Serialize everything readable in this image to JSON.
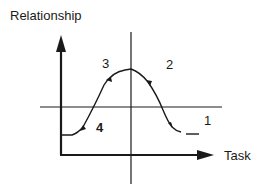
{
  "diagram": {
    "y_axis_label": "Relationship",
    "x_axis_label": "Task",
    "regions": [
      {
        "id": "1",
        "label": "1",
        "position": "lower-right"
      },
      {
        "id": "2",
        "label": "2",
        "position": "upper-right"
      },
      {
        "id": "3",
        "label": "3",
        "position": "upper-left"
      },
      {
        "id": "4",
        "label": "4",
        "position": "lower-left"
      }
    ],
    "curve": "bell-shaped curve rising from low relationship, peaking at the center, then falling"
  },
  "colors": {
    "ink": "#1a1a1a",
    "background": "#ffffff"
  }
}
